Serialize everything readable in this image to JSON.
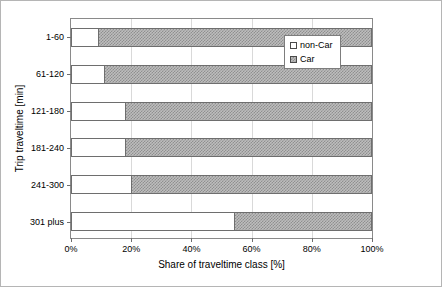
{
  "chart_data": {
    "type": "bar",
    "orientation": "horizontal",
    "stacked": true,
    "normalized": true,
    "title": "",
    "xlabel": "Share of traveltime class [%]",
    "ylabel": "Trip traveltime [min]",
    "xlim": [
      0,
      100
    ],
    "xticks": [
      0,
      20,
      40,
      60,
      80,
      100
    ],
    "xtick_labels": [
      "0%",
      "20%",
      "40%",
      "60%",
      "80%",
      "100%"
    ],
    "grid": "vertical-dashed",
    "legend_position": "upper-right-inside",
    "categories": [
      "1-60",
      "61-120",
      "121-180",
      "181-240",
      "241-300",
      "301 plus"
    ],
    "series": [
      {
        "name": "non-Car",
        "color": "#ffffff",
        "pattern": "solid-white",
        "values": [
          9,
          11,
          18,
          18,
          20,
          54
        ]
      },
      {
        "name": "Car",
        "color": "#bdbdbd",
        "pattern": "dotted-gray",
        "values": [
          91,
          89,
          82,
          82,
          80,
          46
        ]
      }
    ]
  },
  "legend": {
    "entries": [
      {
        "label": "non-Car",
        "swatch": "white-square-icon"
      },
      {
        "label": "Car",
        "swatch": "gray-dotted-square-icon"
      }
    ]
  },
  "colors": {
    "frame": "#b5b5b5",
    "axis": "#8a8a8a",
    "grid": "#d9d9d9",
    "bar_outline": "#6e6e6e",
    "noncar_fill": "#ffffff",
    "car_fill": "#bdbdbd"
  }
}
